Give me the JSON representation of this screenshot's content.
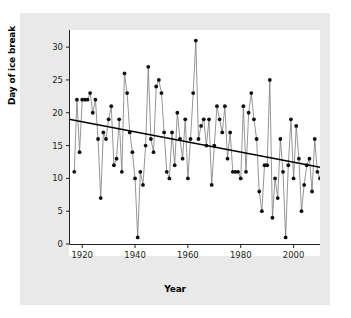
{
  "chart_data": {
    "type": "line",
    "title": "",
    "subtitle": "",
    "xlabel": "Year",
    "ylabel": "Day of ice break",
    "xlim": [
      1915,
      2010
    ],
    "ylim": [
      0,
      32
    ],
    "xticks": [
      1920,
      1940,
      1960,
      1980,
      2000
    ],
    "yticks": [
      0,
      5,
      10,
      15,
      20,
      25,
      30
    ],
    "grid": false,
    "legend": null,
    "marker": "filled-circle",
    "series": [
      {
        "name": "Day of ice break",
        "line_color": "#7a7a7a",
        "marker_color": "#111111",
        "x": [
          1917,
          1918,
          1919,
          1920,
          1921,
          1922,
          1923,
          1924,
          1925,
          1926,
          1927,
          1928,
          1929,
          1930,
          1931,
          1932,
          1933,
          1934,
          1935,
          1936,
          1937,
          1938,
          1939,
          1940,
          1941,
          1942,
          1943,
          1944,
          1945,
          1946,
          1947,
          1948,
          1949,
          1950,
          1951,
          1952,
          1953,
          1954,
          1955,
          1956,
          1957,
          1958,
          1959,
          1960,
          1961,
          1962,
          1963,
          1964,
          1965,
          1966,
          1967,
          1968,
          1969,
          1970,
          1971,
          1972,
          1973,
          1974,
          1975,
          1976,
          1977,
          1978,
          1979,
          1980,
          1981,
          1982,
          1983,
          1984,
          1985,
          1986,
          1987,
          1988,
          1989,
          1990,
          1991,
          1992,
          1993,
          1994,
          1995,
          1996,
          1997,
          1998,
          1999,
          2000,
          2001,
          2002,
          2003,
          2004,
          2005,
          2006,
          2007,
          2008,
          2009,
          2010
        ],
        "y": [
          11,
          22,
          14,
          22,
          22,
          22,
          23,
          20,
          22,
          16,
          7,
          17,
          16,
          19,
          21,
          12,
          13,
          19,
          11,
          26,
          23,
          17,
          14,
          10,
          1,
          11,
          9,
          15,
          27,
          16,
          14,
          24,
          25,
          23,
          17,
          11,
          10,
          17,
          12,
          20,
          16,
          13,
          19,
          10,
          16,
          23,
          31,
          16,
          18,
          19,
          15,
          19,
          9,
          15,
          21,
          19,
          17,
          21,
          13,
          17,
          11,
          11,
          11,
          10,
          21,
          11,
          20,
          23,
          19,
          16,
          8,
          5,
          12,
          12,
          25,
          4,
          10,
          7,
          16,
          11,
          1,
          12,
          19,
          10,
          18,
          13,
          5,
          9,
          12,
          13,
          8,
          16,
          11,
          10
        ]
      }
    ],
    "trendline": {
      "name": "linear-regression",
      "color": "#000000",
      "x": [
        1915,
        2010
      ],
      "y": [
        19.0,
        11.7
      ]
    }
  }
}
